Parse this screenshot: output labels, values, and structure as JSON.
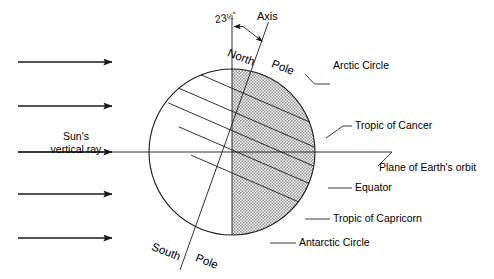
{
  "diagram": {
    "type": "earth-tilt-seasons-diagram",
    "colors": {
      "stroke": "#1a1a1a",
      "shade_fill": "#b8b8b8",
      "background": "#ffffff"
    },
    "geometry": {
      "circle_center_x": 232,
      "circle_center_y": 152,
      "circle_radius": 83,
      "tilt_degrees": 23.5,
      "terminator_x": 232,
      "orbit_plane_y": 152
    }
  },
  "labels": {
    "tilt_angle_value": "23",
    "tilt_angle_fraction": "1/2",
    "tilt_angle_degree": "°",
    "tilt_angle_full": "23½°",
    "axis": "Axis",
    "north": "North",
    "pole_north": "Pole",
    "south": "South",
    "pole_south": "Pole",
    "arctic_circle": "Arctic Circle",
    "tropic_of_cancer": "Tropic of Cancer",
    "plane_of_earths_orbit": "Plane of Earth's orbit",
    "equator": "Equator",
    "tropic_of_capricorn": "Tropic of Capricorn",
    "antarctic_circle": "Antarctic Circle",
    "suns_ray_line1": "Sun's",
    "suns_ray_line2": "vertical ray"
  },
  "sun_rays": [
    {
      "name": "ray-1",
      "y": 62,
      "x_start": 18,
      "x_end": 113
    },
    {
      "name": "ray-2",
      "y": 106,
      "x_start": 18,
      "x_end": 113
    },
    {
      "name": "ray-3",
      "y": 152,
      "x_start": 18,
      "x_end": 113,
      "labeled": true
    },
    {
      "name": "ray-4",
      "y": 194,
      "x_start": 18,
      "x_end": 113
    },
    {
      "name": "ray-5",
      "y": 238,
      "x_start": 18,
      "x_end": 113
    }
  ],
  "latitude_lines": [
    {
      "name": "arctic-circle",
      "offset_from_center": -57.0
    },
    {
      "name": "tropic-of-cancer",
      "offset_from_center": -26.0
    },
    {
      "name": "equator",
      "offset_from_center": 0.0
    },
    {
      "name": "tropic-of-capricorn",
      "offset_from_center": 26.0
    },
    {
      "name": "antarctic-circle",
      "offset_from_center": 57.0
    }
  ]
}
